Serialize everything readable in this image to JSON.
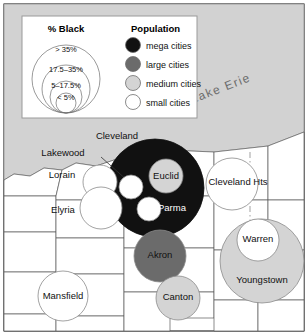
{
  "figure": {
    "kind": "thematic-map",
    "region": "Northeast Ohio",
    "water_label": "Lake Erie"
  },
  "colors": {
    "mega": "#111111",
    "large": "#6b6b6b",
    "medium": "#d4d4d4",
    "small": "#ffffff",
    "lake": "#d2d2d2",
    "land": "#ffffff",
    "border": "#5a5a5a",
    "frame": "#000000",
    "legend_panel": "#ffffff",
    "legend_border": "#9a9a9a",
    "backdrop": "#cfcfcf"
  },
  "legend": {
    "pct_black": {
      "title": "% Black",
      "rings": [
        {
          "label": "> 35%",
          "r": 34
        },
        {
          "label": "17.5–35%",
          "r": 24
        },
        {
          "label": "5–17.5%",
          "r": 16
        },
        {
          "label": "< 5%",
          "r": 10
        }
      ]
    },
    "population": {
      "title": "Population",
      "items": [
        {
          "label": "mega cities",
          "swatch": "mega"
        },
        {
          "label": "large cities",
          "swatch": "large"
        },
        {
          "label": "medium cities",
          "swatch": "medium"
        },
        {
          "label": "small cities",
          "swatch": "small"
        }
      ]
    }
  },
  "chart_data": {
    "type": "bubble-map",
    "title": "",
    "size_variable": "Population",
    "color_variable": "% Black",
    "size_classes": [
      "mega cities",
      "large cities",
      "medium cities",
      "small cities"
    ],
    "color_classes": [
      "> 35%",
      "17.5–35%",
      "5–17.5%",
      "< 5%"
    ],
    "cities": [
      {
        "name": "Cleveland",
        "size_class": "mega cities",
        "color_class": "> 35%",
        "cx": 155,
        "cy": 188,
        "r": 49,
        "label_cx": 117,
        "label_cy": 139,
        "label_fill": "dark",
        "leader": null
      },
      {
        "name": "Lakewood",
        "size_class": "small cities",
        "color_class": "< 5%",
        "cx": 131,
        "cy": 187,
        "r": 12,
        "label_cx": 63,
        "label_cy": 156,
        "label_fill": "dark",
        "leader": {
          "x1": 101,
          "y1": 157,
          "x2": 128,
          "y2": 181
        }
      },
      {
        "name": "Euclid",
        "size_class": "medium cities",
        "color_class": "< 5%",
        "cx": 166,
        "cy": 176,
        "r": 17,
        "label_cx": 166,
        "label_cy": 179,
        "label_fill": "dark",
        "leader": null
      },
      {
        "name": "Parma",
        "size_class": "small cities",
        "color_class": "< 5%",
        "cx": 149,
        "cy": 209,
        "r": 12,
        "label_cx": 172,
        "label_cy": 211,
        "label_fill": "light",
        "leader": null
      },
      {
        "name": "Lorain",
        "size_class": "small cities",
        "color_class": "< 5%",
        "cx": 100,
        "cy": 182,
        "r": 17,
        "label_cx": 62,
        "label_cy": 178,
        "label_fill": "dark",
        "leader": null
      },
      {
        "name": "Elyria",
        "size_class": "small cities",
        "color_class": "< 5%",
        "cx": 101,
        "cy": 208,
        "r": 21,
        "label_cx": 63,
        "label_cy": 213,
        "label_fill": "dark",
        "leader": null
      },
      {
        "name": "Cleveland Hts",
        "size_class": "small cities",
        "color_class": "17.5–35%",
        "cx": 232,
        "cy": 184,
        "r": 26,
        "label_cx": 238,
        "label_cy": 185,
        "label_fill": "dark",
        "leader": null
      },
      {
        "name": "Akron",
        "size_class": "large cities",
        "color_class": "17.5–35%",
        "cx": 160,
        "cy": 256,
        "r": 26,
        "label_cx": 160,
        "label_cy": 258,
        "label_fill": "dark",
        "leader": null
      },
      {
        "name": "Canton",
        "size_class": "medium cities",
        "color_class": "5–17.5%",
        "cx": 178,
        "cy": 298,
        "r": 22,
        "label_cx": 178,
        "label_cy": 300,
        "label_fill": "dark",
        "leader": null
      },
      {
        "name": "Youngstown",
        "size_class": "medium cities",
        "color_class": "17.5–35%",
        "cx": 262,
        "cy": 261,
        "r": 42,
        "label_cx": 262,
        "label_cy": 283,
        "label_fill": "dark",
        "leader": null
      },
      {
        "name": "Warren",
        "size_class": "small cities",
        "color_class": "5–17.5%",
        "cx": 258,
        "cy": 240,
        "r": 21,
        "label_cx": 258,
        "label_cy": 242,
        "label_fill": "dark",
        "leader": null
      },
      {
        "name": "Mansfield",
        "size_class": "small cities",
        "color_class": "5–17.5%",
        "cx": 63,
        "cy": 296,
        "r": 25,
        "label_cx": 63,
        "label_cy": 299,
        "label_fill": "dark",
        "leader": null
      }
    ]
  }
}
